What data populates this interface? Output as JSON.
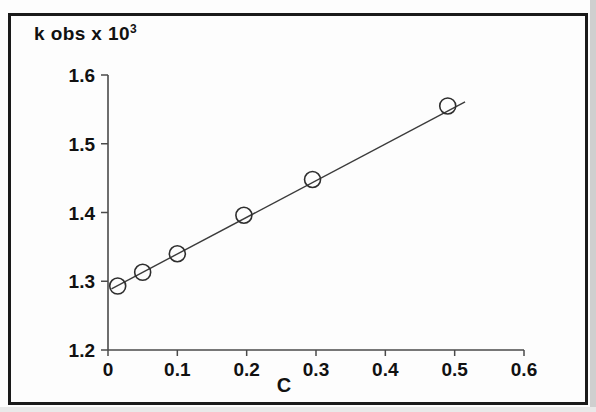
{
  "figure": {
    "ylabel_text": "k obs x 10",
    "ylabel_exponent": "3",
    "xlabel": "C",
    "border_color": "#1a1a1a",
    "line_color": "#3b3b3b",
    "marker_color": "#2e2e2e"
  },
  "chart_data": {
    "type": "scatter",
    "title": "",
    "xlabel": "C",
    "ylabel": "k obs x 10^3",
    "xlim": [
      0,
      0.6
    ],
    "ylim": [
      1.2,
      1.6
    ],
    "grid": false,
    "legend": null,
    "xticks": [
      0,
      0.1,
      0.2,
      0.3,
      0.4,
      0.5,
      0.6
    ],
    "xtick_labels": [
      "0",
      "0.1",
      "0.2",
      "0.3",
      "0.4",
      "0.5",
      "0.6"
    ],
    "yticks": [
      1.2,
      1.3,
      1.4,
      1.5,
      1.6
    ],
    "ytick_labels": [
      "1.2",
      "1.3",
      "1.4",
      "1.5",
      "1.6"
    ],
    "marker_style": "open-circle",
    "series": [
      {
        "name": "k obs",
        "x": [
          0.014,
          0.05,
          0.1,
          0.196,
          0.295,
          0.49
        ],
        "y": [
          1.293,
          1.313,
          1.34,
          1.396,
          1.448,
          1.555
        ]
      }
    ],
    "fit_line": {
      "x": [
        0.005,
        0.515
      ],
      "y": [
        1.289,
        1.561
      ],
      "style": "solid"
    }
  }
}
